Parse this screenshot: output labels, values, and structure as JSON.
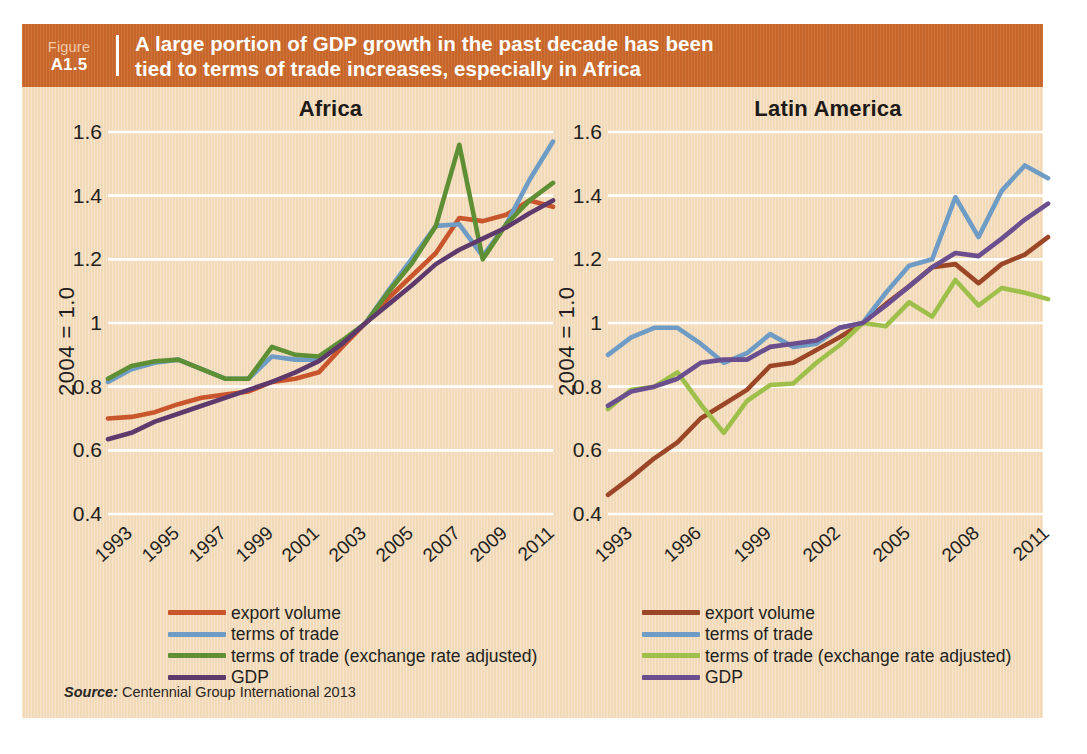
{
  "header": {
    "figure_word": "Figure",
    "figure_number": "A1.5",
    "title_line1": "A large portion of GDP growth in the past decade has been",
    "title_line2": "tied to terms of trade increases, especially in Africa",
    "bar_color": "#c8662a",
    "card_color": "#f2d9b8"
  },
  "y_axis_label": "2004 = 1.0",
  "source": {
    "label": "Source:",
    "text": "Centennial Group International 2013"
  },
  "colors": {
    "export_volume_africa": "#c8552c",
    "terms_of_trade_africa": "#6e9cc4",
    "terms_of_trade_adj_africa": "#5f8f34",
    "gdp_africa": "#5d3a6b",
    "export_volume_latam": "#9b4626",
    "terms_of_trade_latam": "#6e9cc4",
    "terms_of_trade_adj_latam": "#9cc martin",
    "gdp_latam": "#6b4e8e",
    "gridline": "#ffffff",
    "text": "#231f20"
  },
  "chart_data": [
    {
      "type": "line",
      "title": "Africa",
      "xlabel": "",
      "ylabel": "2004 = 1.0",
      "ylim": [
        0.4,
        1.6
      ],
      "yticks": [
        "0.4",
        "0.6",
        "0.8",
        "1",
        "1.2",
        "1.4",
        "1.6"
      ],
      "ytick_values": [
        0.4,
        0.6,
        0.8,
        1,
        1.2,
        1.4,
        1.6
      ],
      "grid": true,
      "legend_position": "below",
      "x": [
        1993,
        1994,
        1995,
        1996,
        1997,
        1998,
        1999,
        2000,
        2001,
        2002,
        2003,
        2004,
        2005,
        2006,
        2007,
        2008,
        2009,
        2010,
        2011,
        2012
      ],
      "xticks": [
        "1993",
        "1995",
        "1997",
        "1999",
        "2001",
        "2003",
        "2005",
        "2007",
        "2009",
        "2011"
      ],
      "xtick_values": [
        1993,
        1995,
        1997,
        1999,
        2001,
        2003,
        2005,
        2007,
        2009,
        2011
      ],
      "series": [
        {
          "name": "export volume",
          "color": "#c8552c",
          "values": [
            0.7,
            0.705,
            0.72,
            0.745,
            0.765,
            0.775,
            0.785,
            0.815,
            0.825,
            0.845,
            0.925,
            1.0,
            1.08,
            1.15,
            1.22,
            1.33,
            1.32,
            1.34,
            1.385,
            1.365
          ]
        },
        {
          "name": "terms of trade",
          "color": "#6e9cc4",
          "values": [
            0.815,
            0.855,
            0.875,
            0.885,
            0.855,
            0.825,
            0.825,
            0.895,
            0.885,
            0.885,
            0.94,
            1.0,
            1.105,
            1.205,
            1.305,
            1.31,
            1.21,
            1.31,
            1.45,
            1.57
          ]
        },
        {
          "name": "terms of trade (exchange rate adjusted)",
          "color": "#5f8f34",
          "values": [
            0.825,
            0.865,
            0.88,
            0.885,
            0.855,
            0.825,
            0.825,
            0.925,
            0.9,
            0.895,
            0.945,
            1.0,
            1.1,
            1.19,
            1.305,
            1.56,
            1.2,
            1.31,
            1.385,
            1.44
          ]
        },
        {
          "name": "GDP",
          "color": "#5d3a6b",
          "values": [
            0.635,
            0.655,
            0.69,
            0.715,
            0.74,
            0.765,
            0.79,
            0.815,
            0.845,
            0.88,
            0.935,
            1.0,
            1.06,
            1.12,
            1.185,
            1.23,
            1.265,
            1.3,
            1.345,
            1.385
          ]
        }
      ]
    },
    {
      "type": "line",
      "title": "Latin America",
      "xlabel": "",
      "ylabel": "2004 = 1.0",
      "ylim": [
        0.4,
        1.6
      ],
      "yticks": [
        "0.4",
        "0.6",
        "0.8",
        "1",
        "1.2",
        "1.4",
        "1.6"
      ],
      "ytick_values": [
        0.4,
        0.6,
        0.8,
        1,
        1.2,
        1.4,
        1.6
      ],
      "grid": true,
      "legend_position": "below",
      "x": [
        1993,
        1994,
        1995,
        1996,
        1997,
        1998,
        1999,
        2000,
        2001,
        2002,
        2003,
        2004,
        2005,
        2006,
        2007,
        2008,
        2009,
        2010,
        2011,
        2012
      ],
      "xticks": [
        "1993",
        "1996",
        "1999",
        "2002",
        "2005",
        "2008",
        "2011"
      ],
      "xtick_values": [
        1993,
        1996,
        1999,
        2002,
        2005,
        2008,
        2011
      ],
      "series": [
        {
          "name": "export volume",
          "color": "#9b4626",
          "values": [
            0.46,
            0.515,
            0.575,
            0.625,
            0.7,
            0.745,
            0.79,
            0.865,
            0.875,
            0.915,
            0.955,
            1.0,
            1.06,
            1.115,
            1.175,
            1.185,
            1.125,
            1.185,
            1.215,
            1.27
          ]
        },
        {
          "name": "terms of trade",
          "color": "#6e9cc4",
          "values": [
            0.9,
            0.955,
            0.985,
            0.985,
            0.935,
            0.875,
            0.905,
            0.965,
            0.925,
            0.935,
            0.985,
            1.0,
            1.095,
            1.18,
            1.2,
            1.395,
            1.27,
            1.415,
            1.495,
            1.455
          ]
        },
        {
          "name": "terms of trade (exchange rate adjusted)",
          "color": "#9ec04a",
          "values": [
            0.73,
            0.79,
            0.8,
            0.845,
            0.745,
            0.655,
            0.755,
            0.805,
            0.81,
            0.875,
            0.93,
            1.0,
            0.99,
            1.065,
            1.02,
            1.135,
            1.055,
            1.11,
            1.095,
            1.075
          ]
        },
        {
          "name": "GDP",
          "color": "#6b4e8e",
          "values": [
            0.74,
            0.785,
            0.8,
            0.825,
            0.875,
            0.885,
            0.885,
            0.925,
            0.935,
            0.945,
            0.985,
            1.0,
            1.055,
            1.115,
            1.175,
            1.22,
            1.21,
            1.265,
            1.325,
            1.375
          ]
        }
      ]
    }
  ],
  "legends": [
    {
      "panel": "africa",
      "items": [
        {
          "label": "export volume",
          "color": "#c8552c"
        },
        {
          "label": "terms of trade",
          "color": "#6e9cc4"
        },
        {
          "label": "terms of trade (exchange rate adjusted)",
          "color": "#5f8f34"
        },
        {
          "label": "GDP",
          "color": "#5d3a6b"
        }
      ]
    },
    {
      "panel": "latam",
      "items": [
        {
          "label": "export volume",
          "color": "#9b4626"
        },
        {
          "label": "terms of trade",
          "color": "#6e9cc4"
        },
        {
          "label": "terms of trade (exchange rate adjusted)",
          "color": "#9ec04a"
        },
        {
          "label": "GDP",
          "color": "#6b4e8e"
        }
      ]
    }
  ]
}
